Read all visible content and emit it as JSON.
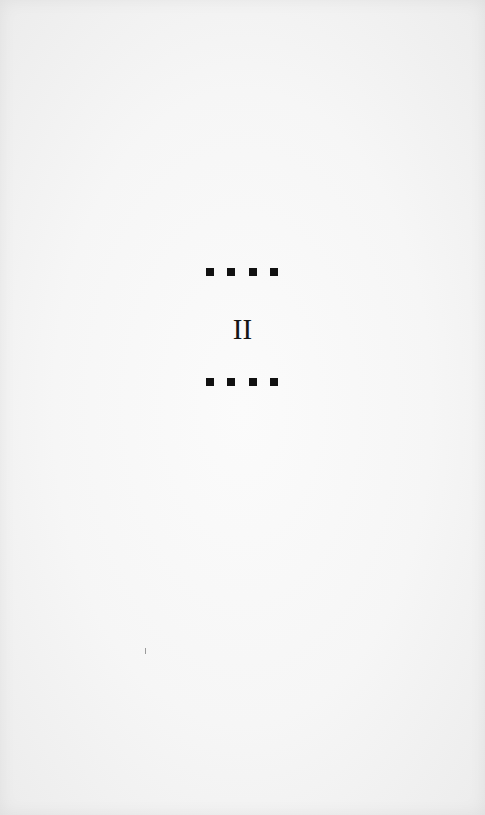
{
  "page": {
    "type": "section-divider",
    "section_numeral": "II",
    "ornaments": {
      "top_row": [
        "square",
        "square",
        "square",
        "square"
      ],
      "bottom_row": [
        "square",
        "square",
        "square",
        "square"
      ]
    },
    "colors": {
      "paper": "#f6f6f6",
      "ink": "#111111"
    }
  }
}
